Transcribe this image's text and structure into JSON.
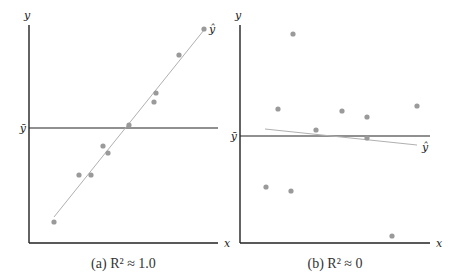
{
  "chart_data": [
    {
      "type": "scatter",
      "panel": "a",
      "caption": "(a) R² ≈ 1.0",
      "caption_prefix": "(a)",
      "caption_formula": "R² ≈ 1.0",
      "xlabel": "x",
      "ylabel": "y",
      "mean_label": "ȳ",
      "fit_label": "ŷ",
      "grid": false,
      "points_px": [
        [
          54,
          222
        ],
        [
          79,
          175
        ],
        [
          91,
          175
        ],
        [
          103,
          146
        ],
        [
          108,
          153
        ],
        [
          129,
          125
        ],
        [
          154,
          102
        ],
        [
          156,
          93
        ],
        [
          179,
          55
        ],
        [
          204,
          29
        ]
      ],
      "fit_line_px": [
        [
          54,
          217
        ],
        [
          204,
          30
        ]
      ],
      "mean_line_y_px": 128,
      "axes_px": {
        "x0": 29,
        "y0": 243,
        "xmax": 218,
        "ytop": 25
      },
      "point_color": "#9a9a9a",
      "line_color": "#b0b0b0"
    },
    {
      "type": "scatter",
      "panel": "b",
      "caption": "(b) R² ≈ 0",
      "caption_prefix": "(b)",
      "caption_formula": "R² ≈ 0",
      "xlabel": "x",
      "ylabel": "y",
      "mean_label": "ȳ",
      "fit_label": "ŷ",
      "grid": false,
      "points_px": [
        [
          293,
          34
        ],
        [
          278,
          109
        ],
        [
          342,
          111
        ],
        [
          367,
          117
        ],
        [
          417,
          106
        ],
        [
          316,
          130
        ],
        [
          367,
          138
        ],
        [
          266,
          187
        ],
        [
          291,
          191
        ],
        [
          392,
          236
        ]
      ],
      "fit_line_px": [
        [
          265,
          129
        ],
        [
          417,
          145
        ]
      ],
      "mean_line_y_px": 136,
      "axes_px": {
        "x0": 240,
        "y0": 243,
        "xmax": 430,
        "ytop": 25
      },
      "point_color": "#9a9a9a",
      "line_color": "#b0b0b0"
    }
  ]
}
